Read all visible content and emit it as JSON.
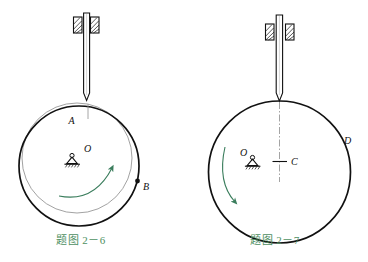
{
  "page": {
    "background": "#ffffff",
    "width": 368,
    "height": 262
  },
  "colors": {
    "ink": "#111111",
    "ghost": "#8a8a8a",
    "arrow_green": "#3a7d5c",
    "caption_green": "#4e8f62"
  },
  "figures": [
    {
      "id": "fig-2-6",
      "caption": "题图 2－6",
      "caption_number": "2－6",
      "labels": {
        "contact_point": "A",
        "center": "O",
        "rim_point": "B"
      },
      "parts": {
        "rod": "vertical-rod",
        "guide": "hatched-bushing",
        "pivot": "fixed-pin-support",
        "disk_current": "thick-circle",
        "disk_previous": "thin-ghost-circle",
        "rotation_arrow": "curved-arrow-ccw"
      }
    },
    {
      "id": "fig-2-7",
      "caption": "题图 2－7",
      "caption_number": "2－7",
      "labels": {
        "center_mark": "C",
        "pivot": "O",
        "rim_point": "D"
      },
      "parts": {
        "rod": "vertical-rod",
        "guide": "hatched-bushing",
        "pivot": "fixed-pin-support",
        "disk": "thick-circle",
        "centerline": "dash-dot-axis",
        "rotation_arrow": "curved-arrow-cw"
      }
    }
  ]
}
